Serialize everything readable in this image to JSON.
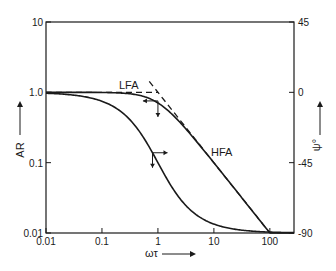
{
  "chart_data": {
    "type": "line",
    "title": "",
    "xlabel": "ωτ",
    "ylabel": "AR",
    "y2label": "ψ°",
    "xscale": "log",
    "yscale": "log",
    "xlim": [
      0.01,
      270
    ],
    "ylim": [
      0.01,
      10
    ],
    "y2lim": [
      -90,
      45
    ],
    "grid": false,
    "legend": "none",
    "x_ticks": [
      {
        "value": 0.01,
        "label": "0.01"
      },
      {
        "value": 0.1,
        "label": "0.1"
      },
      {
        "value": 1,
        "label": "1"
      },
      {
        "value": 10,
        "label": "10"
      },
      {
        "value": 100,
        "label": "100"
      }
    ],
    "y_ticks": [
      {
        "value": 10,
        "label": "10"
      },
      {
        "value": 1,
        "label": "1.0"
      },
      {
        "value": 0.1,
        "label": "0.1"
      },
      {
        "value": 0.01,
        "label": "0.01"
      }
    ],
    "y2_ticks": [
      {
        "value": 45,
        "label": "45"
      },
      {
        "value": 0,
        "label": "0"
      },
      {
        "value": -45,
        "label": "-45"
      },
      {
        "value": -90,
        "label": "-90"
      }
    ],
    "series": [
      {
        "name": "AR",
        "axis": "left",
        "style": "solid",
        "description": "Amplitude ratio of first-order system, AR = 1/sqrt(1+(ωτ)^2)",
        "x": [
          0.01,
          0.1,
          0.3,
          0.5,
          0.7,
          1,
          1.5,
          2,
          3,
          5,
          10,
          20,
          50,
          100
        ],
        "y": [
          1.0,
          0.995,
          0.958,
          0.894,
          0.819,
          0.707,
          0.555,
          0.447,
          0.316,
          0.196,
          0.0995,
          0.05,
          0.02,
          0.01
        ]
      },
      {
        "name": "ψ (phase)",
        "axis": "right",
        "style": "solid",
        "description": "Phase angle ψ = -arctan(ωτ) in degrees",
        "x": [
          0.01,
          0.05,
          0.1,
          0.2,
          0.3,
          0.5,
          0.7,
          1,
          1.5,
          2,
          3,
          5,
          10,
          20,
          50,
          100,
          270
        ],
        "y": [
          -0.6,
          -2.9,
          -5.7,
          -11.3,
          -16.7,
          -26.6,
          -35.0,
          -45.0,
          -56.3,
          -63.4,
          -71.6,
          -78.7,
          -84.3,
          -87.1,
          -88.9,
          -89.4,
          -89.8
        ]
      },
      {
        "name": "LFA",
        "axis": "left",
        "style": "dashed",
        "description": "Low-frequency asymptote AR = 1",
        "x": [
          0.01,
          1
        ],
        "y": [
          1.0,
          1.0
        ]
      },
      {
        "name": "HFA",
        "axis": "left",
        "style": "dashed",
        "description": "High-frequency asymptote AR = 1/(ωτ)",
        "x": [
          0.7,
          100
        ],
        "y": [
          1.43,
          0.01
        ]
      }
    ],
    "annotations": [
      {
        "text": "LFA",
        "x": 0.55,
        "y": 1.35
      },
      {
        "text": "HFA",
        "x": 7,
        "y": 0.2
      },
      {
        "text": "arrow: AR curve reads left axis (down-pointing marker at ωτ=1)",
        "x": 1,
        "y": 0.707
      },
      {
        "text": "arrow: phase curve reads right axis (right-pointing marker at ωτ≈0.8)",
        "x": 0.8,
        "y": -38
      }
    ]
  },
  "labels": {
    "xlabel": "ωτ",
    "ylabel": "AR",
    "y2label": "ψ°",
    "lfa": "LFA",
    "hfa": "HFA"
  }
}
